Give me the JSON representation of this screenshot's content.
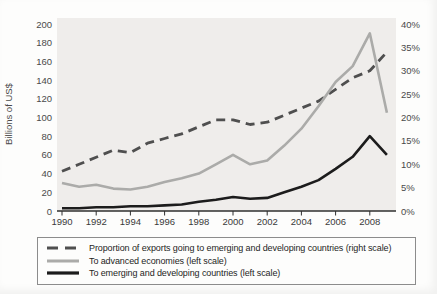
{
  "chart_data": {
    "type": "line",
    "title": "",
    "x": [
      1990,
      1991,
      1992,
      1993,
      1994,
      1995,
      1996,
      1997,
      1998,
      1999,
      2000,
      2001,
      2002,
      2003,
      2004,
      2005,
      2006,
      2007,
      2008,
      2009
    ],
    "x_ticks": [
      1990,
      1992,
      1994,
      1996,
      1998,
      2000,
      2002,
      2004,
      2006,
      2008
    ],
    "left_axis": {
      "label": "Billions of US$",
      "ticks": [
        0,
        20,
        40,
        60,
        80,
        100,
        120,
        140,
        160,
        180,
        200
      ],
      "range": [
        0,
        200
      ]
    },
    "right_axis": {
      "ticks": [
        {
          "value": 0,
          "label": "0%"
        },
        {
          "value": 5,
          "label": "5%"
        },
        {
          "value": 10,
          "label": "10%"
        },
        {
          "value": 15,
          "label": "15%"
        },
        {
          "value": 20,
          "label": "20%"
        },
        {
          "value": 25,
          "label": "25%"
        },
        {
          "value": 30,
          "label": "30%"
        },
        {
          "value": 35,
          "label": "35%"
        },
        {
          "value": 40,
          "label": "40%"
        }
      ],
      "range": [
        0,
        40
      ]
    },
    "grid": false,
    "legend_position": "bottom",
    "plot_background": "#efedeb",
    "series": [
      {
        "id": "proportion-exports-line",
        "name": "Proportion of exports going to emerging and developing countries (right scale)",
        "axis": "right",
        "style": "dashed",
        "color": "#4f4f4f",
        "values": [
          8.5,
          10,
          11.5,
          13,
          12.5,
          14.5,
          15.5,
          16.5,
          18,
          19.5,
          19.5,
          18.5,
          19,
          20.5,
          22,
          23.5,
          26,
          28.5,
          30,
          34
        ]
      },
      {
        "id": "advanced-economies-line",
        "name": "To advanced economies (left scale)",
        "axis": "left",
        "style": "solid",
        "color": "#ababa9",
        "values": [
          30,
          26,
          28,
          24,
          23,
          26,
          31,
          35,
          40,
          50,
          60,
          50,
          54,
          70,
          88,
          112,
          138,
          155,
          190,
          105
        ]
      },
      {
        "id": "emerging-developing-line",
        "name": "To emerging and developing countries (left scale)",
        "axis": "left",
        "style": "solid",
        "color": "#1c1c1c",
        "values": [
          3,
          3,
          4,
          4,
          5,
          5,
          6,
          7,
          10,
          12,
          15,
          13,
          14,
          20,
          26,
          33,
          45,
          58,
          80,
          60
        ]
      }
    ]
  }
}
